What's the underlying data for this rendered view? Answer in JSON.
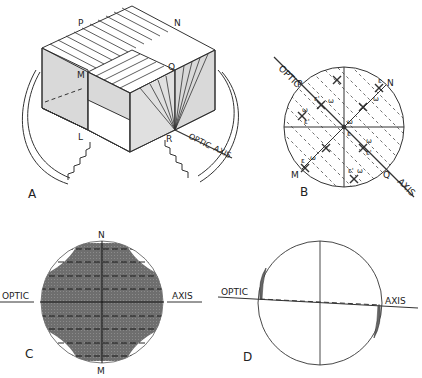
{
  "panels": {
    "A": {
      "label": "A",
      "points": {
        "P": "P",
        "N": "N",
        "M": "M",
        "Q": "Q",
        "L": "L",
        "R": "R"
      },
      "axis_words": {
        "optic": "OPTIC",
        "axis": "AXIS"
      }
    },
    "B": {
      "label": "B",
      "points": {
        "P": "P",
        "N": "N",
        "M": "M",
        "Q": "Q"
      },
      "axis_words": {
        "optic": "OPTIC",
        "axis": "AXIS"
      },
      "symbols": {
        "omega": "ω",
        "epsilon": "ε",
        "epsilon_prime": "ε'"
      }
    },
    "C": {
      "label": "C",
      "points": {
        "N": "N",
        "M": "M"
      },
      "axis_words": {
        "optic": "OPTIC",
        "axis": "AXIS"
      }
    },
    "D": {
      "label": "D",
      "axis_words": {
        "optic": "OPTIC",
        "axis": "AXIS"
      }
    }
  },
  "colors": {
    "line": "#333333",
    "shade_light": "#d9d9d9",
    "shade_dark": "#707070"
  }
}
